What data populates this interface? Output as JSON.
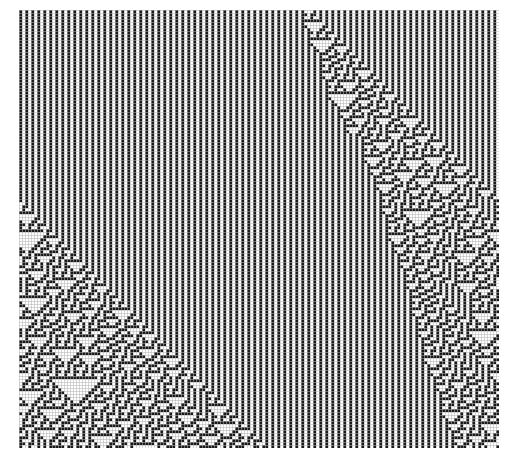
{
  "figure": {
    "kind": "cellular-automaton-spacetime-diagram",
    "caption": ""
  },
  "canvas": {
    "width": 516,
    "height": 464,
    "background_color": "#ffffff"
  },
  "plot_area": {
    "left": 19,
    "top": 10,
    "right": 498,
    "bottom": 446,
    "width": 479,
    "height": 436
  },
  "automaton": {
    "rule_number": 30,
    "rule_binary": "00011110",
    "states": 2,
    "neighborhood": 3,
    "cell_size_px": 3,
    "columns": 160,
    "rows": 146,
    "initial_condition": "single-black-cell",
    "seed_column": 96,
    "background_initial": "periodic",
    "background_period": 2,
    "boundary": "periodic",
    "on_color": "#1a1a1a",
    "off_color": "#ffffff",
    "grid_line_color": "#b5b5b5",
    "grid_visible": true
  },
  "chart_data": {
    "type": "heatmap",
    "subtitle": "",
    "xlabel": "cell position",
    "ylabel": "time step (downward)",
    "legend": [
      {
        "label": "state 1 (black)",
        "color": "#1a1a1a"
      },
      {
        "label": "state 0 (white)",
        "color": "#ffffff"
      }
    ],
    "legend_position": "none",
    "grid": true,
    "xlim": [
      0,
      160
    ],
    "ylim": [
      0,
      146
    ],
    "x_tick_labels": [],
    "y_tick_labels": [],
    "annotations": [],
    "rule_table": [
      {
        "neighborhood": "111",
        "result": 0
      },
      {
        "neighborhood": "110",
        "result": 0
      },
      {
        "neighborhood": "101",
        "result": 0
      },
      {
        "neighborhood": "100",
        "result": 1
      },
      {
        "neighborhood": "011",
        "result": 1
      },
      {
        "neighborhood": "010",
        "result": 1
      },
      {
        "neighborhood": "001",
        "result": 1
      },
      {
        "neighborhood": "000",
        "result": 0
      }
    ],
    "series": [
      {
        "name": "chaotic band left boundary (column index by row)",
        "x": [
          0,
          20,
          40,
          60,
          80,
          100,
          120,
          146
        ],
        "values": [
          72,
          66,
          58,
          50,
          44,
          38,
          32,
          26
        ]
      },
      {
        "name": "chaotic band right boundary (column index by row)",
        "x": [
          0,
          20,
          40,
          60,
          80,
          100,
          120,
          146
        ],
        "values": [
          86,
          84,
          82,
          80,
          78,
          76,
          74,
          72
        ]
      }
    ]
  }
}
